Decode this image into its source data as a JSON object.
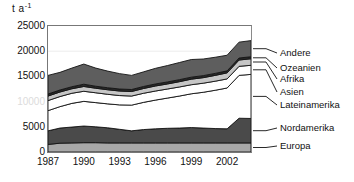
{
  "chart_data": {
    "type": "area",
    "stacked": true,
    "title": "",
    "xlabel": "",
    "ylabel": "t a-1",
    "ylabel_display": "t a",
    "ylabel_exponent": "-1",
    "x": [
      1987,
      1988,
      1989,
      1990,
      1991,
      1992,
      1993,
      1994,
      1995,
      1996,
      1997,
      1998,
      1999,
      2000,
      2001,
      2002,
      2003,
      2004
    ],
    "xlim": [
      1987,
      2004
    ],
    "ylim": [
      0,
      25000
    ],
    "ytick_values": [
      0,
      5000,
      10000,
      15000,
      20000,
      25000
    ],
    "ytick_labels": [
      "0",
      "5000",
      "10000",
      "15000",
      "20000",
      "25000"
    ],
    "xtick_values": [
      1987,
      1990,
      1993,
      1996,
      1999,
      2002
    ],
    "xtick_labels": [
      "1987",
      "1990",
      "1993",
      "1996",
      "1999",
      "2002"
    ],
    "grid": "horizontal-faint",
    "legend_position": "right-outside",
    "series": [
      {
        "name": "Europa",
        "color": "#a8a8a8",
        "values": [
          1500,
          1750,
          1800,
          1850,
          1850,
          1800,
          1800,
          1800,
          1800,
          1800,
          1800,
          1800,
          1800,
          1800,
          1800,
          1800,
          1800,
          1800
        ]
      },
      {
        "name": "Nordamerika",
        "color": "#4a4a4a",
        "values": [
          2700,
          3000,
          3150,
          3300,
          3150,
          3000,
          2700,
          2400,
          2650,
          2800,
          2900,
          2950,
          3050,
          2950,
          2850,
          2800,
          4900,
          4850
        ]
      },
      {
        "name": "Lateinamerika",
        "color": "#ffffff",
        "values": [
          4000,
          4250,
          4700,
          4900,
          4800,
          4750,
          4850,
          5100,
          5400,
          5700,
          6000,
          6350,
          6700,
          7100,
          7600,
          8100,
          8500,
          8750
        ]
      },
      {
        "name": "Asien",
        "color": "#ffffff",
        "values": [
          2000,
          2000,
          2000,
          2000,
          1950,
          1900,
          1850,
          1800,
          1800,
          1800,
          1800,
          1800,
          1800,
          1800,
          1800,
          1800,
          1800,
          1800
        ]
      },
      {
        "name": "Afrika",
        "color": "#c6c6c6",
        "values": [
          900,
          900,
          900,
          950,
          900,
          900,
          900,
          900,
          950,
          1000,
          1000,
          1050,
          1100,
          1100,
          1150,
          1200,
          1250,
          1300
        ]
      },
      {
        "name": "Ozeanien",
        "color": "#2a2a2a",
        "values": [
          400,
          400,
          400,
          450,
          400,
          400,
          400,
          400,
          400,
          400,
          400,
          400,
          400,
          400,
          400,
          400,
          400,
          400
        ]
      },
      {
        "name": "Andere",
        "color": "#5e5e5e",
        "values": [
          3700,
          3500,
          3700,
          4000,
          3600,
          3300,
          3050,
          2800,
          2900,
          3100,
          3250,
          3400,
          3500,
          3300,
          3200,
          3100,
          3150,
          3200
        ]
      }
    ]
  },
  "legend": {
    "items": [
      {
        "label": "Andere",
        "series": "Andere"
      },
      {
        "label": "Ozeanien",
        "series": "Ozeanien"
      },
      {
        "label": "Afrika",
        "series": "Afrika"
      },
      {
        "label": "Asien",
        "series": "Asien"
      },
      {
        "label": "Lateinamerika",
        "series": "Lateinamerika"
      },
      {
        "label": "Nordamerika",
        "series": "Nordamerika"
      },
      {
        "label": "Europa",
        "series": "Europa"
      }
    ]
  },
  "colors": {
    "frame": "#777777",
    "gridline": "#ececec",
    "outline": "#141414",
    "background": "#ffffff",
    "text": "#111111"
  }
}
